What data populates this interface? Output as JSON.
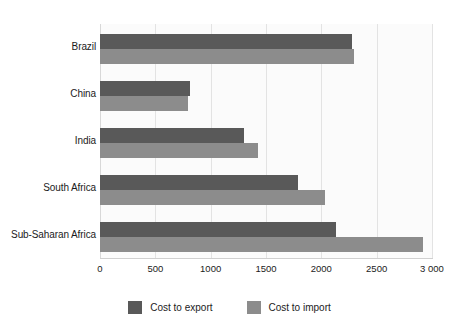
{
  "chart_data": {
    "type": "bar",
    "orientation": "horizontal",
    "title": "",
    "xlabel": "",
    "ylabel": "",
    "categories": [
      "Brazil",
      "China",
      "India",
      "South Africa",
      "Sub-Saharan Africa"
    ],
    "series": [
      {
        "name": "Cost to export",
        "color": "#595959",
        "values": [
          2275,
          815,
          1305,
          1790,
          2130
        ]
      },
      {
        "name": "Cost to import",
        "color": "#8c8c8c",
        "values": [
          2295,
          795,
          1430,
          2035,
          2920
        ]
      }
    ],
    "xlim": [
      0,
      3000
    ],
    "xticks": [
      0,
      500,
      1000,
      1500,
      2000,
      2500,
      3000
    ],
    "xtick_labels": [
      "0",
      "500",
      "1000",
      "1500",
      "2000",
      "2500",
      "3 000"
    ],
    "grid": true,
    "grid_axis": "x",
    "legend_position": "bottom",
    "legend": [
      "Cost to export",
      "Cost to import"
    ]
  },
  "colors": {
    "export_bar": "#595959",
    "import_bar": "#8c8c8c",
    "gridline": "#e3e3e3",
    "plot_background": "#fbfbfb",
    "text": "#1b1b1b"
  }
}
